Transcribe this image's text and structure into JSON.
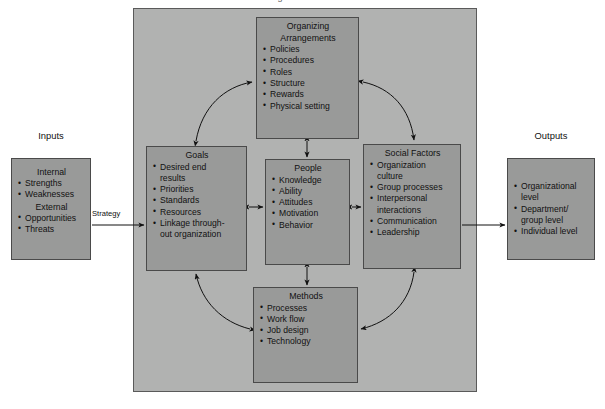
{
  "colors": {
    "container_fill": "#b1b2b1",
    "box_fill": "#999a99",
    "box_border": "#4a4a4a",
    "text": "#111111",
    "page_bg": "#ffffff"
  },
  "title_cropped": "Organizational Model",
  "sides": {
    "inputs_caption": "Inputs",
    "outputs_caption": "Outputs"
  },
  "inputs_box": {
    "heading_internal": "Internal",
    "internal_items": [
      "Strengths",
      "Weaknesses"
    ],
    "heading_external": "External",
    "external_items": [
      "Opportunities",
      "Threats"
    ]
  },
  "outputs_box": {
    "items": [
      {
        "text": "Organizational",
        "cont": "level"
      },
      {
        "text": "Department/",
        "cont": "group level"
      },
      {
        "text": "Individual level",
        "cont": ""
      }
    ]
  },
  "strategy_arrow": {
    "label": "Strategy"
  },
  "goals_box": {
    "title": "Goals",
    "items": [
      {
        "text": "Desired end",
        "cont": "results"
      },
      {
        "text": "Priorities",
        "cont": ""
      },
      {
        "text": "Standards",
        "cont": ""
      },
      {
        "text": "Resources",
        "cont": ""
      },
      {
        "text": "Linkage through-",
        "cont": "out organization"
      }
    ]
  },
  "organizing_box": {
    "title_line1": "Organizing",
    "title_line2": "Arrangements",
    "items": [
      "Policies",
      "Procedures",
      "Roles",
      "Structure",
      "Rewards",
      "Physical setting"
    ]
  },
  "people_box": {
    "title": "People",
    "items": [
      "Knowledge",
      "Ability",
      "Attitudes",
      "Motivation",
      "Behavior"
    ]
  },
  "social_box": {
    "title": "Social Factors",
    "items": [
      {
        "text": "Organization",
        "cont": "culture"
      },
      {
        "text": "Group processes",
        "cont": ""
      },
      {
        "text": "Interpersonal",
        "cont": "interactions"
      },
      {
        "text": "Communication",
        "cont": ""
      },
      {
        "text": "Leadership",
        "cont": ""
      }
    ]
  },
  "methods_box": {
    "title": "Methods",
    "items": [
      "Processes",
      "Work flow",
      "Job design",
      "Technology"
    ]
  }
}
